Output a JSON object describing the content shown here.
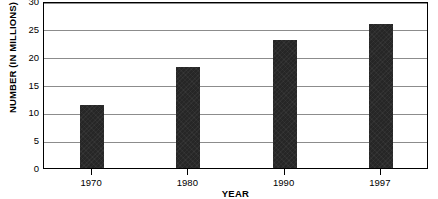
{
  "chart_data": {
    "type": "bar",
    "title": "",
    "xlabel": "YEAR",
    "ylabel": "NUMBER (IN MILLIONS)",
    "categories": [
      "1970",
      "1980",
      "1990",
      "1997"
    ],
    "values": [
      11.3,
      18.2,
      23.0,
      25.9
    ],
    "ylim": [
      0,
      30
    ],
    "ytick_labels": [
      "30",
      "25",
      "20",
      "15",
      "10",
      "5",
      "0"
    ],
    "ytick_values": [
      30,
      25,
      20,
      15,
      10,
      5,
      0
    ],
    "grid": true,
    "legend": "none",
    "bar_color": "#262626",
    "grid_color": "#8c8c8c",
    "axis_color": "#000000",
    "background_color": "#ffffff"
  }
}
